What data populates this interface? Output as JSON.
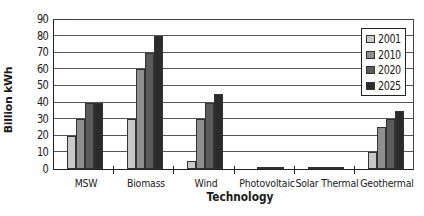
{
  "chart_data": {
    "type": "bar",
    "title": "",
    "xlabel": "Technology",
    "ylabel": "Billion kWh",
    "ylim": [
      0,
      90
    ],
    "yticks": [
      0,
      10,
      20,
      30,
      40,
      50,
      60,
      70,
      80,
      90
    ],
    "grid": true,
    "legend_position": "upper right (inside plot)",
    "categories": [
      "MSW",
      "Biomass",
      "Wind",
      "Photovoltaic",
      "Solar Thermal",
      "Geothermal"
    ],
    "series": [
      {
        "name": "2001",
        "color": "#c9c9c9",
        "values": [
          20,
          30,
          5,
          0,
          0.5,
          10
        ]
      },
      {
        "name": "2010",
        "color": "#8e8e8e",
        "values": [
          30,
          60,
          30,
          0.5,
          0.5,
          25
        ]
      },
      {
        "name": "2020",
        "color": "#5c5c5c",
        "values": [
          40,
          70,
          40,
          1,
          0.5,
          30
        ]
      },
      {
        "name": "2025",
        "color": "#2b2b2b",
        "values": [
          40,
          80,
          45,
          1,
          0.5,
          35
        ]
      }
    ]
  }
}
